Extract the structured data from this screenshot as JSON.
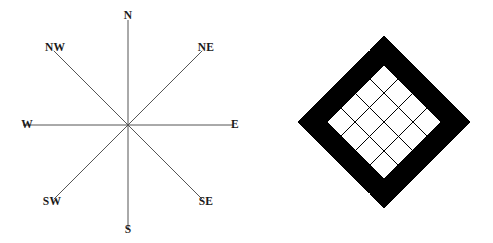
{
  "figure": {
    "width": 493,
    "height": 243,
    "background_color": "#ffffff",
    "ink_color": "#1a1a1a"
  },
  "compass": {
    "name": "compass-rose",
    "center": {
      "x": 128,
      "y": 125
    },
    "stroke_color": "#555555",
    "stroke_width": 1,
    "ray_length": 105,
    "labels": [
      {
        "id": "n",
        "text": "N",
        "angle_deg": 90,
        "x": 128,
        "y": 16
      },
      {
        "id": "ne",
        "text": "NE",
        "angle_deg": 45,
        "x": 206,
        "y": 48
      },
      {
        "id": "e",
        "text": "E",
        "angle_deg": 0,
        "x": 235,
        "y": 125
      },
      {
        "id": "se",
        "text": "SE",
        "angle_deg": -45,
        "x": 206,
        "y": 202
      },
      {
        "id": "s",
        "text": "S",
        "angle_deg": -90,
        "x": 128,
        "y": 230
      },
      {
        "id": "sw",
        "text": "SW",
        "angle_deg": -135,
        "x": 52,
        "y": 202
      },
      {
        "id": "w",
        "text": "W",
        "angle_deg": 180,
        "x": 27,
        "y": 125
      },
      {
        "id": "nw",
        "text": "NW",
        "angle_deg": 135,
        "x": 55,
        "y": 48
      }
    ]
  },
  "diamond": {
    "name": "checkered-diamond",
    "grid_rows": 6,
    "grid_cols": 6,
    "rotation_deg": 45,
    "center": {
      "x": 124,
      "y": 122
    },
    "cell_size": 20.2,
    "fill_black": "#000000",
    "fill_white": "#ffffff",
    "grid_line_color": "#000000",
    "grid_line_width": 1,
    "pattern_description": "outer ring black, inner 4x4 white",
    "cells": [
      [
        1,
        1,
        1,
        1,
        1,
        1
      ],
      [
        1,
        0,
        0,
        0,
        0,
        1
      ],
      [
        1,
        0,
        0,
        0,
        0,
        1
      ],
      [
        1,
        0,
        0,
        0,
        0,
        1
      ],
      [
        1,
        0,
        0,
        0,
        0,
        1
      ],
      [
        1,
        1,
        1,
        1,
        1,
        1
      ]
    ]
  }
}
